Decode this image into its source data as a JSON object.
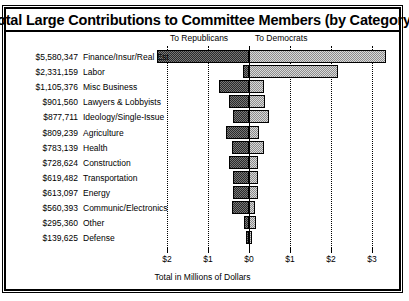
{
  "title": "Total Large Contributions to Committee Members (by Category)",
  "headers": {
    "republicans": "To Republicans",
    "democrats": "To Democrats"
  },
  "axis_title": "Total in Millions of Dollars",
  "ticks": [
    {
      "label": "$2",
      "value": -2
    },
    {
      "label": "$1",
      "value": -1
    },
    {
      "label": "$0",
      "value": 0
    },
    {
      "label": "$1",
      "value": 1
    },
    {
      "label": "$2",
      "value": 2
    },
    {
      "label": "$3",
      "value": 3
    }
  ],
  "chart_data": {
    "type": "bar",
    "title": "Total Large Contributions to Committee Members (by Category)",
    "xlabel": "Total in Millions of Dollars",
    "ylabel": "",
    "orientation": "horizontal",
    "stacked_diverging": true,
    "xlim": [
      -2.45,
      3.45
    ],
    "xticks": [
      -2,
      -1,
      0,
      1,
      2,
      3
    ],
    "xticklabels": [
      "$2",
      "$1",
      "$0",
      "$1",
      "$2",
      "$3"
    ],
    "grid": "vertical-dotted",
    "legend": [
      "To Republicans",
      "To Democrats"
    ],
    "legend_position": "top",
    "categories": [
      "Finance/Insur/Real Est",
      "Labor",
      "Misc Business",
      "Lawyers & Lobbyists",
      "Ideology/Single-Issue",
      "Agriculture",
      "Health",
      "Construction",
      "Transportation",
      "Energy",
      "Communic/Electronics",
      "Other",
      "Defense"
    ],
    "totals_text": [
      "$5,580,347",
      "$2,331,159",
      "$1,105,376",
      "$901,560",
      "$877,711",
      "$809,239",
      "$783,139",
      "$728,624",
      "$619,482",
      "$613,097",
      "$560,393",
      "$295,360",
      "$139,625"
    ],
    "totals": [
      5580347,
      2331159,
      1105376,
      901560,
      877711,
      809239,
      783139,
      728624,
      619482,
      613097,
      560393,
      295360,
      139625
    ],
    "series": [
      {
        "name": "To Republicans",
        "values_millions": [
          2.24,
          0.15,
          0.73,
          0.5,
          0.39,
          0.56,
          0.42,
          0.5,
          0.39,
          0.4,
          0.42,
          0.12,
          0.07
        ]
      },
      {
        "name": "To Democrats",
        "values_millions": [
          3.34,
          2.18,
          0.37,
          0.4,
          0.49,
          0.25,
          0.36,
          0.23,
          0.23,
          0.21,
          0.14,
          0.18,
          0.07
        ]
      }
    ]
  },
  "rows": [
    {
      "amount": "$5,580,347",
      "category": "Finance/Insur/Real Est",
      "rep": 2.24,
      "dem": 3.34
    },
    {
      "amount": "$2,331,159",
      "category": "Labor",
      "rep": 0.15,
      "dem": 2.18
    },
    {
      "amount": "$1,105,376",
      "category": "Misc Business",
      "rep": 0.73,
      "dem": 0.37
    },
    {
      "amount": "$901,560",
      "category": "Lawyers & Lobbyists",
      "rep": 0.5,
      "dem": 0.4
    },
    {
      "amount": "$877,711",
      "category": "Ideology/Single-Issue",
      "rep": 0.39,
      "dem": 0.49
    },
    {
      "amount": "$809,239",
      "category": "Agriculture",
      "rep": 0.56,
      "dem": 0.25
    },
    {
      "amount": "$783,139",
      "category": "Health",
      "rep": 0.42,
      "dem": 0.36
    },
    {
      "amount": "$728,624",
      "category": "Construction",
      "rep": 0.5,
      "dem": 0.23
    },
    {
      "amount": "$619,482",
      "category": "Transportation",
      "rep": 0.39,
      "dem": 0.23
    },
    {
      "amount": "$613,097",
      "category": "Energy",
      "rep": 0.4,
      "dem": 0.21
    },
    {
      "amount": "$560,393",
      "category": "Communic/Electronics",
      "rep": 0.42,
      "dem": 0.14
    },
    {
      "amount": "$295,360",
      "category": "Other",
      "rep": 0.12,
      "dem": 0.18
    },
    {
      "amount": "$139,625",
      "category": "Defense",
      "rep": 0.07,
      "dem": 0.07
    }
  ]
}
